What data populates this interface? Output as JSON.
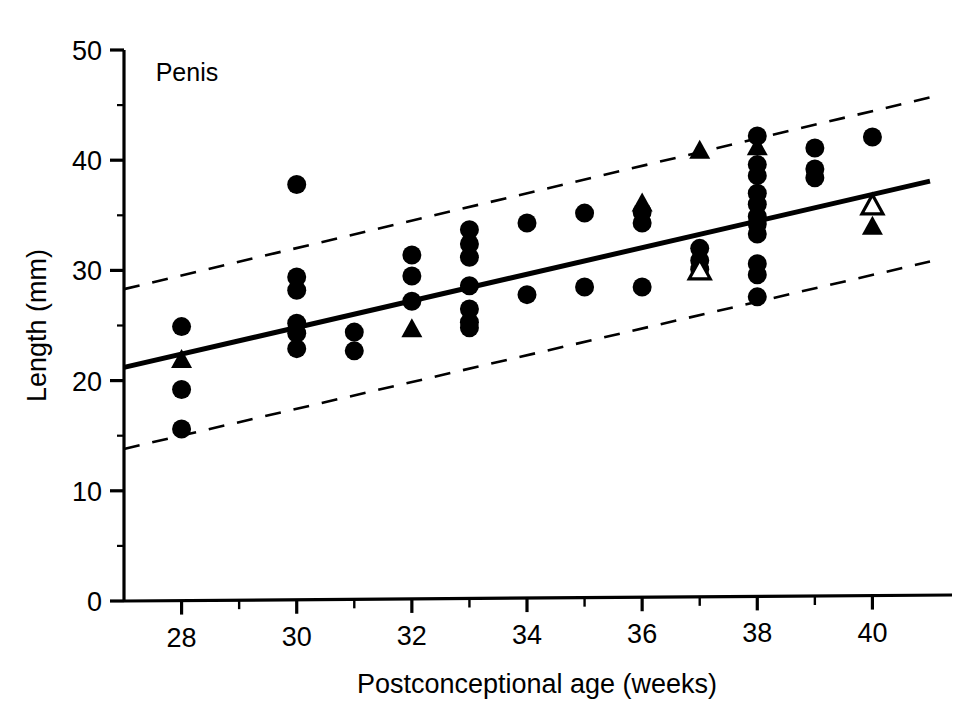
{
  "chart_data": {
    "type": "scatter",
    "title": "",
    "annotation": "Penis",
    "xlabel": "Postconceptional age (weeks)",
    "ylabel": "Length (mm)",
    "xlim": [
      27,
      41
    ],
    "ylim": [
      0,
      50
    ],
    "xticks": [
      28,
      30,
      32,
      34,
      36,
      38,
      40
    ],
    "xtick_labels": [
      "28",
      "30",
      "32",
      "34",
      "36",
      "38",
      "40"
    ],
    "xminor_ticks": [
      29,
      31,
      33,
      35,
      37,
      39
    ],
    "yticks": [
      0,
      10,
      20,
      30,
      40,
      50
    ],
    "ytick_labels": [
      "0",
      "10",
      "20",
      "30",
      "40",
      "50"
    ],
    "yminor_ticks": [
      5,
      15,
      25,
      35,
      45
    ],
    "grid": false,
    "legend": "none",
    "axis_color": "#000000",
    "marker_color": "#000000",
    "series": [
      {
        "name": "measurements-circle",
        "marker": "filled-circle",
        "points": [
          [
            28.0,
            24.9
          ],
          [
            28.0,
            19.2
          ],
          [
            28.0,
            15.6
          ],
          [
            30.0,
            37.8
          ],
          [
            30.0,
            29.4
          ],
          [
            30.0,
            28.2
          ],
          [
            30.0,
            25.2
          ],
          [
            30.0,
            24.3
          ],
          [
            30.0,
            22.9
          ],
          [
            31.0,
            24.4
          ],
          [
            31.0,
            22.7
          ],
          [
            32.0,
            31.4
          ],
          [
            32.0,
            29.5
          ],
          [
            32.0,
            27.2
          ],
          [
            33.0,
            33.7
          ],
          [
            33.0,
            32.4
          ],
          [
            33.0,
            31.2
          ],
          [
            33.0,
            28.6
          ],
          [
            33.0,
            26.5
          ],
          [
            33.0,
            25.3
          ],
          [
            33.0,
            24.8
          ],
          [
            34.0,
            34.3
          ],
          [
            34.0,
            27.8
          ],
          [
            35.0,
            35.2
          ],
          [
            35.0,
            28.5
          ],
          [
            36.0,
            35.3
          ],
          [
            36.0,
            34.3
          ],
          [
            36.0,
            28.5
          ],
          [
            37.0,
            32.0
          ],
          [
            37.0,
            30.9
          ],
          [
            37.0,
            30.1
          ],
          [
            38.0,
            42.2
          ],
          [
            38.0,
            39.6
          ],
          [
            38.0,
            38.6
          ],
          [
            38.0,
            37.0
          ],
          [
            38.0,
            36.0
          ],
          [
            38.0,
            34.9
          ],
          [
            38.0,
            34.2
          ],
          [
            38.0,
            33.3
          ],
          [
            38.0,
            30.6
          ],
          [
            38.0,
            29.6
          ],
          [
            38.0,
            27.6
          ],
          [
            39.0,
            41.1
          ],
          [
            39.0,
            39.2
          ],
          [
            39.0,
            38.4
          ],
          [
            40.0,
            42.1
          ]
        ]
      },
      {
        "name": "measurements-filled-triangle",
        "marker": "filled-triangle",
        "points": [
          [
            28.0,
            22.0
          ],
          [
            32.0,
            24.8
          ],
          [
            36.0,
            36.2
          ],
          [
            37.0,
            41.0
          ],
          [
            38.0,
            41.3
          ],
          [
            40.0,
            36.0
          ],
          [
            40.0,
            34.1
          ]
        ]
      },
      {
        "name": "measurements-open-triangle",
        "marker": "open-triangle",
        "points": [
          [
            37.0,
            30.1
          ],
          [
            40.0,
            36.0
          ]
        ]
      }
    ],
    "lines": [
      {
        "name": "regression-line",
        "style": "solid",
        "width": 5,
        "x": [
          27,
          41
        ],
        "y": [
          21.2,
          38.1
        ]
      },
      {
        "name": "upper-confidence-limit",
        "style": "dashed",
        "width": 2.6,
        "x": [
          27,
          41
        ],
        "y": [
          28.3,
          45.7
        ]
      },
      {
        "name": "lower-confidence-limit",
        "style": "dashed",
        "width": 2.6,
        "x": [
          27,
          41
        ],
        "y": [
          13.8,
          30.8
        ]
      }
    ]
  }
}
